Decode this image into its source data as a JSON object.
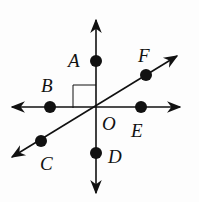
{
  "diagram": {
    "type": "intersecting-lines",
    "center": {
      "label": "O",
      "x": 96,
      "y": 107
    },
    "lines": [
      {
        "name": "vertical",
        "x1": 96,
        "y1": 20,
        "x2": 96,
        "y2": 193
      },
      {
        "name": "horizontal",
        "x1": 12,
        "y1": 107,
        "x2": 180,
        "y2": 107
      },
      {
        "name": "diagonal",
        "x1": 12,
        "y1": 157,
        "x2": 177,
        "y2": 56
      }
    ],
    "points": [
      {
        "label": "A",
        "x": 96,
        "y": 61,
        "lx": 68,
        "ly": 67
      },
      {
        "label": "B",
        "x": 50,
        "y": 107,
        "lx": 41,
        "ly": 92
      },
      {
        "label": "C",
        "x": 41,
        "y": 141,
        "lx": 40,
        "ly": 170
      },
      {
        "label": "D",
        "x": 96,
        "y": 153,
        "lx": 108,
        "ly": 163
      },
      {
        "label": "E",
        "x": 141,
        "y": 107,
        "lx": 131,
        "ly": 137
      },
      {
        "label": "F",
        "x": 146,
        "y": 75,
        "lx": 138,
        "ly": 62
      }
    ],
    "center_label": {
      "text": "O",
      "lx": 102,
      "ly": 130
    },
    "right_angle_marker": {
      "x": 73,
      "y": 85,
      "size": 23
    },
    "line_color": "#111111"
  }
}
